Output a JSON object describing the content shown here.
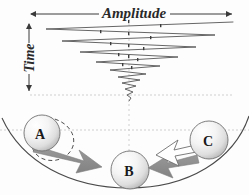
{
  "figure": {
    "background_color": "#fdfdfd"
  },
  "axes": {
    "amplitude": {
      "label": "Amplitude",
      "orientation": "horizontal",
      "arrow_style": "double-headed",
      "x_start": 30,
      "x_end": 233,
      "y": 14
    },
    "time": {
      "label": "Time",
      "orientation": "vertical-rotated",
      "arrow_style": "double-headed",
      "x": 29,
      "y_start": 23,
      "y_end": 92
    }
  },
  "waveform": {
    "description": "Damped zigzag oscillation decaying toward the centre line",
    "color": "#555555",
    "center_x": 129,
    "vertices": [
      {
        "x": 233,
        "y": 22
      },
      {
        "x": 46,
        "y": 29
      },
      {
        "x": 215,
        "y": 35
      },
      {
        "x": 62,
        "y": 41
      },
      {
        "x": 196,
        "y": 47
      },
      {
        "x": 80,
        "y": 52
      },
      {
        "x": 178,
        "y": 57
      },
      {
        "x": 96,
        "y": 62
      },
      {
        "x": 160,
        "y": 66
      },
      {
        "x": 110,
        "y": 70
      },
      {
        "x": 146,
        "y": 74
      },
      {
        "x": 118,
        "y": 77
      },
      {
        "x": 140,
        "y": 80
      },
      {
        "x": 122,
        "y": 83
      },
      {
        "x": 136,
        "y": 86
      },
      {
        "x": 125,
        "y": 89
      },
      {
        "x": 133,
        "y": 92
      },
      {
        "x": 127,
        "y": 95
      },
      {
        "x": 131,
        "y": 98
      },
      {
        "x": 129,
        "y": 101
      }
    ]
  },
  "guides": {
    "color": "#cfcfcf",
    "horizontal_lines": [
      {
        "y": 95,
        "x_start": 30,
        "x_end": 233
      },
      {
        "y": 130,
        "x_start": 0,
        "x_end": 249
      }
    ],
    "vertical_line": {
      "x": 129,
      "y_start": 14,
      "y_end": 155
    }
  },
  "bowl": {
    "description": "Concave bowl / potential well curve",
    "color": "#4a4a4a"
  },
  "balls": [
    {
      "id": "A",
      "label": "A",
      "cx": 42,
      "cy": 133,
      "r": 18,
      "position": "left upper slope",
      "has_rotation_arc": true,
      "arrow": {
        "type": "filled-gray",
        "direction": "down-right",
        "color": "#8d8d8d"
      }
    },
    {
      "id": "B",
      "label": "B",
      "cx": 130,
      "cy": 170,
      "r": 19,
      "position": "bottom of bowl",
      "has_rotation_arc": false,
      "arrow": null
    },
    {
      "id": "C",
      "label": "C",
      "cx": 209,
      "cy": 140,
      "r": 19,
      "position": "right upper slope",
      "has_rotation_arc": false,
      "arrow": {
        "type": "outlined-white-over-gray",
        "direction": "left",
        "color": "#ffffff"
      }
    }
  ],
  "colors": {
    "ink": "#2a2a2a",
    "arrow_gray": "#8d8d8d",
    "arrow_white": "#ffffff",
    "arrow_outline": "#6e6e6e",
    "guide_gray": "#cfcfcf",
    "wave_gray": "#555555",
    "ball_light": "#ffffff",
    "ball_dark": "#bdbdbd"
  }
}
